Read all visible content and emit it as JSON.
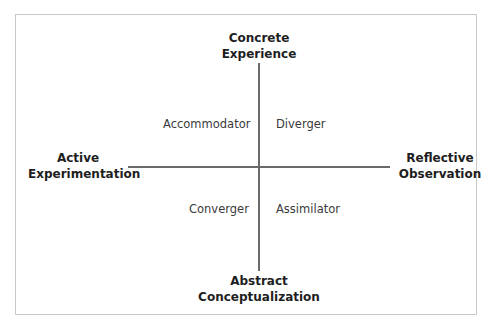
{
  "diagram": {
    "axes": {
      "top": {
        "line1": "Concrete",
        "line2": "Experience"
      },
      "bottom": {
        "line1": "Abstract",
        "line2": "Conceptualization"
      },
      "left": {
        "line1": "Active",
        "line2": "Experimentation"
      },
      "right": {
        "line1": "Reflective",
        "line2": "Observation"
      }
    },
    "quadrants": {
      "top_left": "Accommodator",
      "top_right": "Diverger",
      "bottom_left": "Converger",
      "bottom_right": "Assimilator"
    },
    "colors": {
      "line": "#6a6a6a",
      "frame": "#c8c8c8",
      "text": "#2a2a2a"
    }
  }
}
